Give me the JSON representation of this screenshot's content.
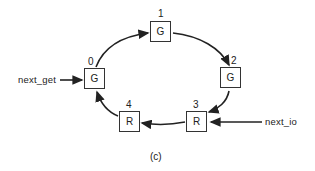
{
  "diagram": {
    "caption": "(c)",
    "nodes": [
      {
        "index": "0",
        "state": "G"
      },
      {
        "index": "1",
        "state": "G"
      },
      {
        "index": "2",
        "state": "G"
      },
      {
        "index": "3",
        "state": "R"
      },
      {
        "index": "4",
        "state": "R"
      }
    ],
    "pointers": {
      "next_get": "next_get",
      "next_io": "next_io"
    },
    "edges": [
      {
        "from": "0",
        "to": "1"
      },
      {
        "from": "1",
        "to": "2"
      },
      {
        "from": "2",
        "to": "3"
      },
      {
        "from": "3",
        "to": "4"
      },
      {
        "from": "4",
        "to": "0"
      }
    ]
  }
}
